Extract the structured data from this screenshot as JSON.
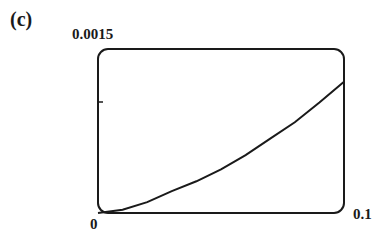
{
  "panel_label": "(c)",
  "chart_data": {
    "type": "line",
    "title": "",
    "xlabel": "",
    "ylabel": "",
    "xlim": [
      0,
      0.1
    ],
    "ylim": [
      0,
      0.0015
    ],
    "x_tick_labels": [
      "0",
      "0.1"
    ],
    "y_tick_labels": [
      "0.0015"
    ],
    "grid": false,
    "legend": null,
    "series": [
      {
        "name": "curve",
        "x": [
          0,
          0.01,
          0.02,
          0.03,
          0.04,
          0.05,
          0.06,
          0.07,
          0.08,
          0.09,
          0.1
        ],
        "y": [
          0,
          3e-05,
          0.0001,
          0.0002,
          0.00029,
          0.0004,
          0.00053,
          0.00068,
          0.00083,
          0.00101,
          0.0012
        ]
      }
    ]
  },
  "axis": {
    "y_top_label": "0.0015",
    "x_origin_label": "0",
    "x_max_label": "0.1"
  },
  "colors": {
    "line": "#1a1a1a",
    "frame": "#1a1a1a",
    "background": "#ffffff"
  }
}
